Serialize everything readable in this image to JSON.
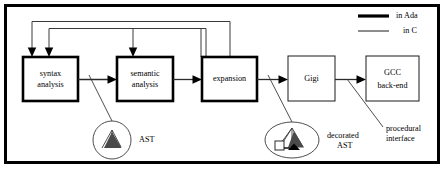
{
  "figure": {
    "frame": {
      "stroke": "#000000",
      "width": 3
    },
    "colors": {
      "ada_stroke": "#000000",
      "c_stroke": "#555555",
      "text": "#000000",
      "background": "#ffffff"
    }
  },
  "legend": {
    "items": [
      {
        "id": "ada",
        "label": "in Ada",
        "line_weight": "thick"
      },
      {
        "id": "c",
        "label": "in C",
        "line_weight": "thin"
      }
    ]
  },
  "boxes": [
    {
      "id": "syntax-analysis",
      "label_line1": "syntax",
      "label_line2": "analysis",
      "implemented_in": "in Ada"
    },
    {
      "id": "semantic-analysis",
      "label_line1": "semantic",
      "label_line2": "analysis",
      "implemented_in": "in Ada"
    },
    {
      "id": "expansion",
      "label_line1": "expansion",
      "label_line2": "",
      "implemented_in": "in Ada"
    },
    {
      "id": "gigi",
      "label_line1": "Gigi",
      "label_line2": "",
      "implemented_in": "in C"
    },
    {
      "id": "gcc-back-end",
      "label_line1": "GCC",
      "label_line2": "back-end",
      "implemented_in": "in C"
    }
  ],
  "annotations": [
    {
      "id": "ast",
      "label_line1": "AST",
      "label_line2": ""
    },
    {
      "id": "decorated-ast",
      "label_line1": "decorated",
      "label_line2": "AST"
    },
    {
      "id": "procedural-interface",
      "label_line1": "procedural",
      "label_line2": "interface"
    }
  ],
  "flow": {
    "forward_arrows": [
      {
        "from": "syntax-analysis",
        "to": "semantic-analysis"
      },
      {
        "from": "semantic-analysis",
        "to": "expansion"
      },
      {
        "from": "expansion",
        "to": "gigi"
      },
      {
        "from": "gigi",
        "to": "gcc-back-end"
      }
    ],
    "feedback_arrows": [
      {
        "from": "semantic-analysis",
        "to": "syntax-analysis"
      },
      {
        "from": "expansion",
        "to": "syntax-analysis"
      },
      {
        "from": "expansion",
        "to": "semantic-analysis"
      }
    ]
  }
}
